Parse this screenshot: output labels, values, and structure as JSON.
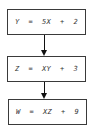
{
  "diagram": {
    "type": "flowchart",
    "nodes": [
      {
        "id": "step1",
        "label": "Y  =  5X  +  2"
      },
      {
        "id": "step2",
        "label": "Z  =  XY  +  3"
      },
      {
        "id": "step3",
        "label": "W  =  XZ  +  9"
      }
    ],
    "edges": [
      {
        "from": "step1",
        "to": "step2"
      },
      {
        "from": "step2",
        "to": "step3"
      }
    ],
    "colors": {
      "border": "#3a3a3a",
      "arrow": "#111111",
      "text": "#333333",
      "background": "#ffffff"
    }
  }
}
